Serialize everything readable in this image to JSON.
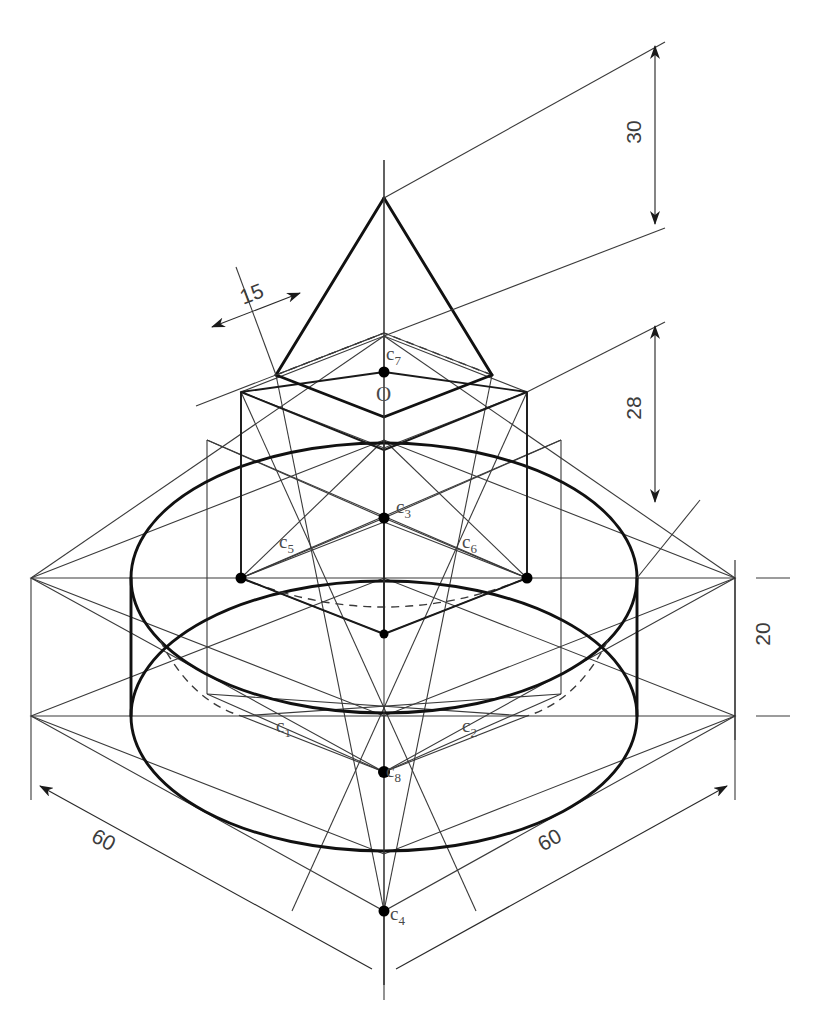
{
  "drawing": {
    "title": "Isometric projection of cone on square prism on cylinder",
    "background": "#ffffff",
    "line_color": "#111111",
    "thin_line_color": "#3a3a3a",
    "hidden_line_style": "dashed"
  },
  "dimensions": [
    {
      "id": "dim-30",
      "value": "30",
      "orientation": "vertical",
      "x": 632,
      "y": 131,
      "rotated": true
    },
    {
      "id": "dim-28",
      "value": "28",
      "orientation": "vertical",
      "x": 632,
      "y": 407,
      "rotated": true
    },
    {
      "id": "dim-20",
      "value": "20",
      "orientation": "vertical",
      "x": 761,
      "y": 632,
      "rotated": true
    },
    {
      "id": "dim-15",
      "value": "15",
      "orientation": "isometric-left",
      "x": 253,
      "y": 292,
      "rotated": false
    },
    {
      "id": "dim-60-left",
      "value": "60",
      "orientation": "isometric-left",
      "x": 106,
      "y": 838,
      "rotated": false
    },
    {
      "id": "dim-60-right",
      "value": "60",
      "orientation": "isometric-right",
      "x": 551,
      "y": 838,
      "rotated": false
    }
  ],
  "point_labels": [
    {
      "id": "label-c7",
      "base": "c",
      "sub": "7",
      "x": 386,
      "y": 355,
      "dot_x": 384,
      "dot_y": 372
    },
    {
      "id": "label-O",
      "base": "O",
      "sub": "",
      "x": 381,
      "y": 392,
      "dot_x": null,
      "dot_y": null
    },
    {
      "id": "label-c3",
      "base": "c",
      "sub": "3",
      "x": 396,
      "y": 505,
      "dot_x": 384,
      "dot_y": 518
    },
    {
      "id": "label-c5",
      "base": "c",
      "sub": "5",
      "x": 281,
      "y": 539,
      "dot_x": 241,
      "dot_y": 578
    },
    {
      "id": "label-c6",
      "base": "c",
      "sub": "6",
      "x": 462,
      "y": 539,
      "dot_x": 527,
      "dot_y": 578
    },
    {
      "id": "label-c1",
      "base": "c",
      "sub": "1",
      "x": 278,
      "y": 723,
      "dot_x": null,
      "dot_y": null
    },
    {
      "id": "label-c2",
      "base": "c",
      "sub": "2",
      "x": 462,
      "y": 723,
      "dot_x": null,
      "dot_y": null
    },
    {
      "id": "label-c8",
      "base": "c",
      "sub": "8",
      "x": 386,
      "y": 768,
      "dot_x": 384,
      "dot_y": 772
    },
    {
      "id": "label-c4",
      "base": "c",
      "sub": "4",
      "x": 390,
      "y": 910,
      "dot_x": 384,
      "dot_y": 911
    }
  ],
  "geometry": {
    "center_x": 384,
    "bbox_left_x": 31,
    "bbox_right_x": 735,
    "cone_apex_y": 198,
    "prism_top_y": 392,
    "cylinder_top_y": 578,
    "cylinder_bottom_y": 716,
    "front_corner_y": 911
  }
}
